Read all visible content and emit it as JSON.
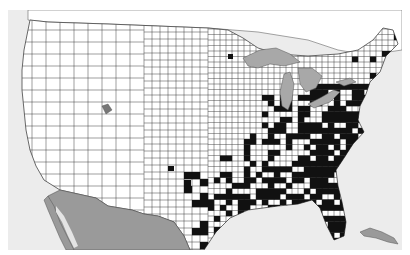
{
  "map": {
    "type": "choropleth",
    "region": "United States counties (contiguous) with southern Canada and northern Mexico",
    "colors": {
      "ocean": "#ececec",
      "land_us": "#ffffff",
      "land_other": "#9a9a9a",
      "lakes": "#a8a8a8",
      "county_border": "#555555",
      "highlighted_county": "#111111",
      "frame_margin": "#ffffff"
    },
    "legend": [],
    "labels": [],
    "highlight_pattern": "Black-filled counties concentrated across the eastern US: Ohio Valley, Mid-Atlantic, Southeast, Gulf Coast and Florida; a few scattered counties in Texas, Kansas and Oklahoma; nearly none west of the Great Plains"
  },
  "chart_data": {
    "type": "heatmap",
    "title": "",
    "categories": [
      "not highlighted",
      "highlighted"
    ],
    "regions_highlighted": [
      "Ohio",
      "Indiana",
      "Kentucky",
      "Tennessee",
      "West Virginia",
      "Virginia",
      "North Carolina",
      "South Carolina",
      "Georgia",
      "Florida",
      "Alabama",
      "Mississippi",
      "Louisiana",
      "Arkansas",
      "Pennsylvania",
      "New York",
      "Maryland",
      "East Texas"
    ],
    "regions_not_highlighted": [
      "Pacific Northwest",
      "California",
      "Great Basin",
      "Rocky Mountains",
      "Great Plains",
      "Upper Midwest"
    ],
    "legend": []
  }
}
